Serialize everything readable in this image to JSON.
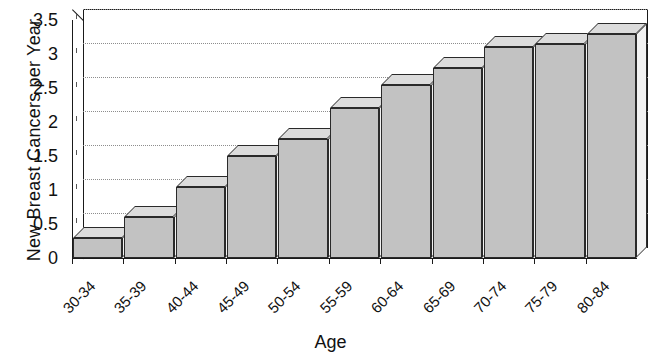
{
  "chart_data": {
    "type": "bar",
    "title": "",
    "xlabel": "Age",
    "ylabel": "New Breast Cancers per Year",
    "categories": [
      "30-34",
      "35-39",
      "40-44",
      "45-49",
      "50-54",
      "55-59",
      "60-64",
      "65-69",
      "70-74",
      "75-79",
      "80-84"
    ],
    "values": [
      0.3,
      0.6,
      1.05,
      1.5,
      1.75,
      2.2,
      2.55,
      2.8,
      3.1,
      3.15,
      3.3
    ],
    "ylim": [
      0,
      3.5
    ],
    "yticks": [
      0,
      0.5,
      1,
      1.5,
      2,
      2.5,
      3,
      3.5
    ],
    "ytick_labels": [
      "0",
      "0.5",
      "1",
      "1.5",
      "2",
      "2.5",
      "3",
      "3.5"
    ],
    "grid": true,
    "grid_orientation": "horizontal",
    "grid_style": "dotted",
    "legend": false,
    "style": "3d-bar",
    "bar_color": "#c2c2c2",
    "bar_top_color": "#dcdcdc",
    "bar_side_color": "#f2f2f2",
    "bar_edge_color": "#2a2a2a",
    "background": "#ffffff",
    "axis_color": "#1a1a1a",
    "grid_color": "#8d8d8d"
  }
}
